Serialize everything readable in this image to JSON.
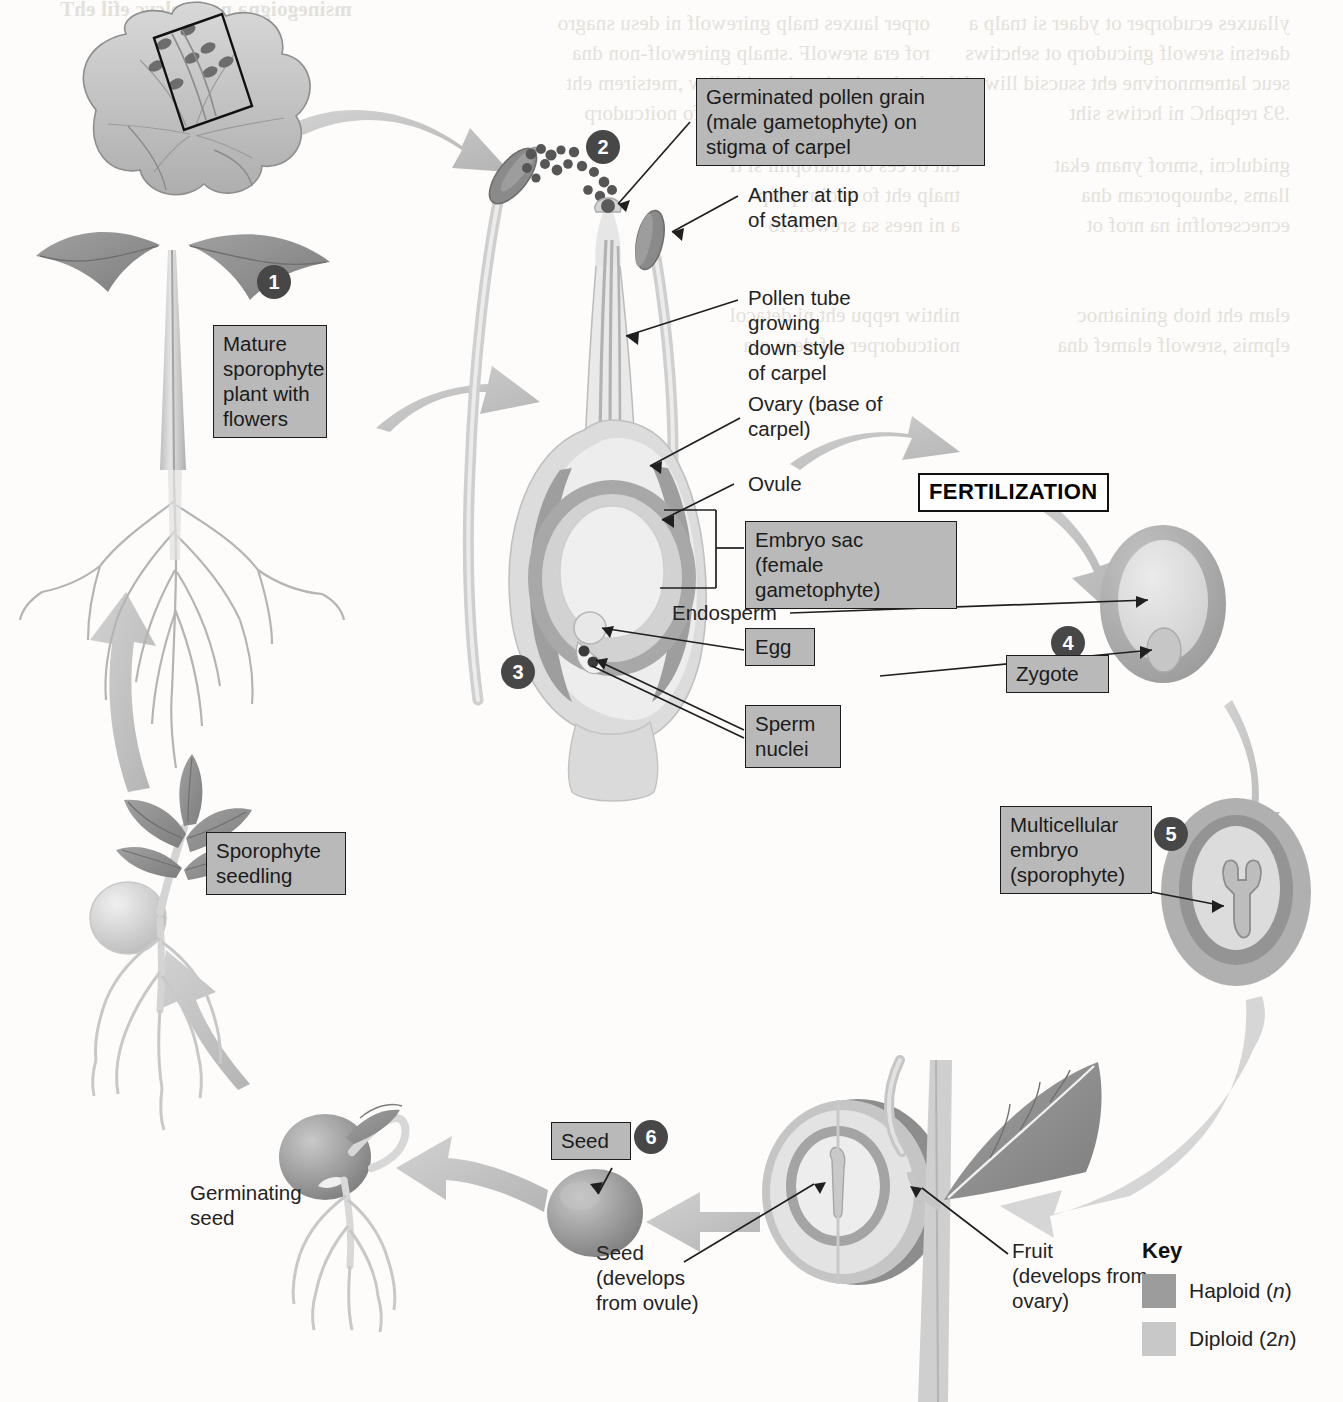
{
  "diagram": {
    "fertilization_label": "FERTILIZATION"
  },
  "steps": [
    {
      "number": "1"
    },
    {
      "number": "2"
    },
    {
      "number": "3"
    },
    {
      "number": "4"
    },
    {
      "number": "5"
    },
    {
      "number": "6"
    }
  ],
  "boxed_labels": {
    "mature_plant": "Mature\nsporophyte\nplant with\nflowers",
    "pollen_grain": "Germinated pollen grain\n(male gametophyte) on\nstigma of carpel",
    "embryo_sac": "Embryo sac\n(female\ngametophyte)",
    "egg": "Egg",
    "sperm_nuclei": "Sperm\nnuclei",
    "zygote": "Zygote",
    "multicellular_embryo": "Multicellular\nembryo\n(sporophyte)",
    "sporophyte_seedling": "Sporophyte\nseedling",
    "seed": "Seed"
  },
  "leader_labels": {
    "anther": "Anther at tip\nof stamen",
    "pollen_tube": "Pollen tube\ngrowing\ndown style\nof carpel",
    "ovary": "Ovary (base of\ncarpel)",
    "ovule": "Ovule",
    "endosperm": "Endosperm",
    "germinating_seed": "Germinating\nseed",
    "seed_develops": "Seed\n(develops\nfrom ovule)",
    "fruit_develops": "Fruit\n(develops from\novary)"
  },
  "key": {
    "title": "Key",
    "entries": [
      {
        "label": "Haploid (",
        "italic": "n",
        "close": ")",
        "color": "#9c9c9c"
      },
      {
        "label": "Diploid (2",
        "italic": "n",
        "close": ")",
        "color": "#c8c8c8"
      }
    ]
  },
  "colors": {
    "haploid": "#9c9c9c",
    "diploid": "#c8c8c8",
    "label_box_fill": "#b9b9b9",
    "step_circle": "#474747",
    "cycle_arrow": "#c3c3c3",
    "leaf_dark": "#8f8f8f",
    "stem": "#cdcdcd"
  },
  "ghost_text": {
    "top_title": "The life cycle of an angiosperm",
    "col_a": "organs used in flowering plant sexual repro\nand non-flowering plants. Flowers are form\nthe meristem, which is otherwise involved\nproduction of new vegetative structures.",
    "col_b": "a plant is ready to reproduce sexually\nswitches to producing flowers instead\nWe will discuss the environmental cues\nthis switch in Chapter 39."
  }
}
